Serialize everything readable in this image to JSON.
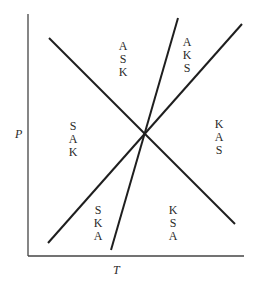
{
  "diagram": {
    "axes": {
      "x_label": "T",
      "y_label": "P"
    },
    "lines": [
      {
        "name": "descending-line",
        "x1": 49,
        "y1": 38,
        "x2": 235,
        "y2": 224
      },
      {
        "name": "steep-line",
        "x1": 178,
        "y1": 18,
        "x2": 111,
        "y2": 250
      },
      {
        "name": "ascending-line",
        "x1": 48,
        "y1": 243,
        "x2": 242,
        "y2": 24
      }
    ],
    "intersection": {
      "x": 145,
      "y": 133
    },
    "regions": [
      {
        "id": "top-center",
        "letters": [
          "A",
          "S",
          "K"
        ]
      },
      {
        "id": "top-right",
        "letters": [
          "A",
          "K",
          "S"
        ]
      },
      {
        "id": "left",
        "letters": [
          "S",
          "A",
          "K"
        ]
      },
      {
        "id": "right",
        "letters": [
          "K",
          "A",
          "S"
        ]
      },
      {
        "id": "bottom-left",
        "letters": [
          "S",
          "K",
          "A"
        ]
      },
      {
        "id": "bottom-right",
        "letters": [
          "K",
          "S",
          "A"
        ]
      }
    ],
    "colors": {
      "line": "#1e1e1e",
      "axis": "#333333"
    }
  }
}
